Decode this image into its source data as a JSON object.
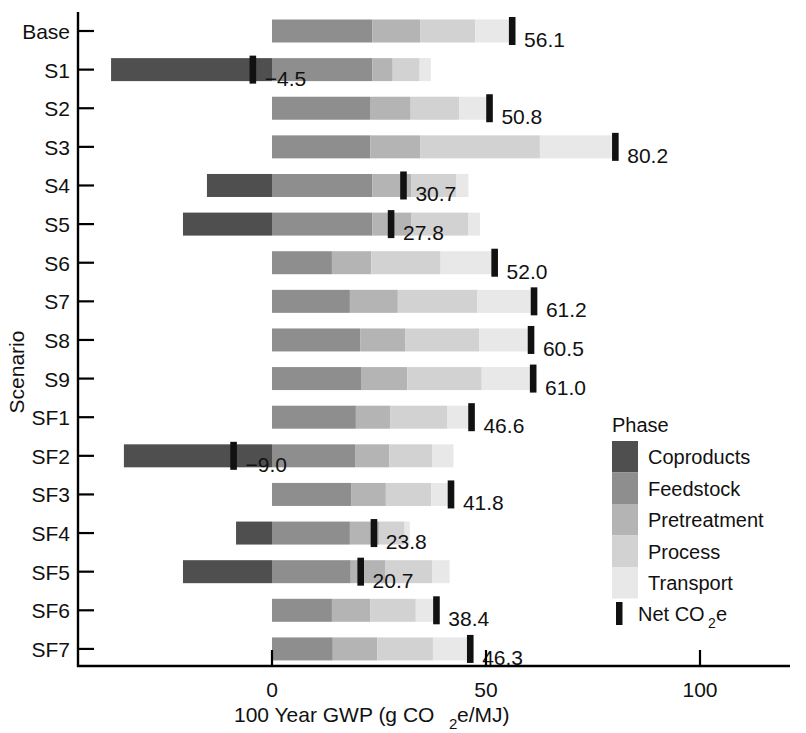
{
  "chart_data": {
    "type": "bar",
    "orientation": "horizontal",
    "stacked": true,
    "title": "",
    "xlabel": "100 Year GWP (g CO2e/MJ)",
    "ylabel": "Scenario",
    "xlim": [
      -42,
      120
    ],
    "xticks": [
      0,
      50,
      100
    ],
    "xtick_labels": [
      "0",
      "50",
      "100"
    ],
    "grid": false,
    "legend": {
      "title": "Phase",
      "position": "right",
      "entries": [
        "Coproducts",
        "Feedstock",
        "Pretreatment",
        "Process",
        "Transport"
      ],
      "marker_entry": "Net CO2e"
    },
    "colors": {
      "Coproducts": "#4f4f4f",
      "Feedstock": "#8e8e8e",
      "Pretreatment": "#b4b4b4",
      "Process": "#d2d2d2",
      "Transport": "#e8e8e8",
      "NetMarker": "#121212"
    },
    "categories": [
      "Base",
      "S1",
      "S2",
      "S3",
      "S4",
      "S5",
      "S6",
      "S7",
      "S8",
      "S9",
      "SF1",
      "SF2",
      "SF3",
      "SF4",
      "SF5",
      "SF6",
      "SF7"
    ],
    "series": [
      {
        "name": "Coproducts",
        "values": [
          0.0,
          -37.6,
          0.0,
          0.0,
          -15.2,
          -20.8,
          0.0,
          0.0,
          0.0,
          0.0,
          0.0,
          -34.6,
          0.0,
          -8.4,
          -20.8,
          0.0,
          0.0
        ]
      },
      {
        "name": "Feedstock",
        "values": [
          23.4,
          23.4,
          22.9,
          23.0,
          23.4,
          23.4,
          14.0,
          18.2,
          20.6,
          20.8,
          19.6,
          19.4,
          18.6,
          18.2,
          18.4,
          14.0,
          14.2
        ]
      },
      {
        "name": "Pretreatment",
        "values": [
          11.2,
          4.8,
          9.5,
          11.6,
          9.2,
          9.2,
          9.2,
          11.2,
          10.6,
          10.8,
          8.0,
          8.0,
          8.0,
          6.8,
          8.0,
          9.0,
          10.4
        ]
      },
      {
        "name": "Process",
        "values": [
          12.9,
          6.3,
          11.4,
          28.0,
          10.4,
          13.2,
          16.2,
          18.6,
          17.2,
          17.4,
          13.4,
          10.0,
          10.6,
          6.0,
          11.0,
          10.6,
          13.0
        ]
      },
      {
        "name": "Transport",
        "values": [
          8.6,
          2.6,
          7.0,
          17.6,
          2.9,
          2.8,
          12.6,
          13.2,
          12.1,
          12.0,
          5.6,
          5.0,
          4.6,
          1.2,
          4.1,
          4.8,
          8.7
        ]
      }
    ],
    "net_values": [
      56.1,
      -4.5,
      50.8,
      80.2,
      30.7,
      27.8,
      52.0,
      61.2,
      60.5,
      61.0,
      46.6,
      -9.0,
      41.8,
      23.8,
      20.7,
      38.4,
      46.3
    ],
    "net_labels": [
      "56.1",
      "−4.5",
      "50.8",
      "80.2",
      "30.7",
      "27.8",
      "52.0",
      "61.2",
      "60.5",
      "61.0",
      "46.6",
      "−9.0",
      "41.8",
      "23.8",
      "20.7",
      "38.4",
      "46.3"
    ]
  },
  "axes": {
    "x_title": "100 Year GWP (g CO",
    "x_title_sub": "2",
    "x_title_tail": "e/MJ)",
    "y_title": "Scenario"
  },
  "legend": {
    "title": "Phase",
    "net_label_head": "Net CO",
    "net_label_sub": "2",
    "net_label_tail": "e"
  }
}
